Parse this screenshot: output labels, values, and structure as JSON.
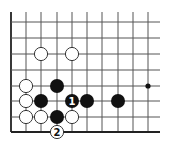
{
  "diagram": {
    "type": "go-board-fragment",
    "grid": {
      "columns_x": [
        11,
        26,
        41,
        57,
        72,
        87,
        102,
        118,
        133,
        148
      ],
      "rows_y": [
        22,
        38,
        54,
        70,
        86,
        101,
        117,
        132
      ],
      "top_extent": 12,
      "right_extent": 160,
      "left_edge_is_board_edge": true,
      "bottom_edge_is_board_edge": true,
      "line_color": "#555555",
      "edge_color": "#222222"
    },
    "stone_radius": 7,
    "colors": {
      "black_stone": "#111111",
      "white_stone_fill": "#ffffff",
      "white_stone_stroke": "#222222",
      "black_label": "#ffffff",
      "white_label": "#111111"
    },
    "stones": [
      {
        "color": "white",
        "col": 2,
        "row": 2,
        "label": ""
      },
      {
        "color": "white",
        "col": 4,
        "row": 2,
        "label": ""
      },
      {
        "color": "white",
        "col": 1,
        "row": 4,
        "label": ""
      },
      {
        "color": "black",
        "col": 3,
        "row": 4,
        "label": ""
      },
      {
        "color": "white",
        "col": 1,
        "row": 5,
        "label": ""
      },
      {
        "color": "black",
        "col": 2,
        "row": 5,
        "label": ""
      },
      {
        "color": "black",
        "col": 4,
        "row": 5,
        "label": "1"
      },
      {
        "color": "black",
        "col": 5,
        "row": 5,
        "label": ""
      },
      {
        "color": "black",
        "col": 7,
        "row": 5,
        "label": ""
      },
      {
        "color": "white",
        "col": 1,
        "row": 6,
        "label": ""
      },
      {
        "color": "white",
        "col": 2,
        "row": 6,
        "label": ""
      },
      {
        "color": "black",
        "col": 3,
        "row": 6,
        "label": ""
      },
      {
        "color": "white",
        "col": 4,
        "row": 6,
        "label": ""
      },
      {
        "color": "white",
        "col": 3,
        "row": 7,
        "label": "2"
      }
    ],
    "star_points": [
      {
        "col": 9,
        "row": 4
      }
    ],
    "move_labels": [
      "1",
      "2"
    ]
  }
}
